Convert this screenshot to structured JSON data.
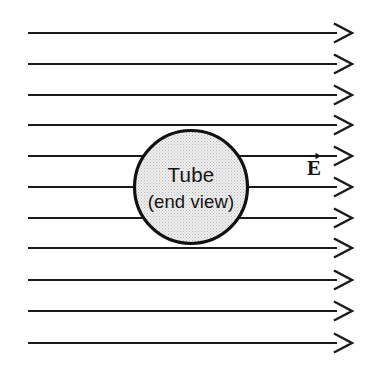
{
  "figure": {
    "kind": "physics-diagram",
    "background_color": "#ffffff",
    "ink_color": "#1a1a1a",
    "width": 375,
    "height": 370
  },
  "tube": {
    "label_line1": "Tube",
    "label_line2": "(end view)",
    "shape": "circle",
    "center_x": 191,
    "center_y": 187,
    "radius": 56.5,
    "fill_color": "#e8e8e8",
    "fill_pattern": "stipple-halftone",
    "stroke_color": "#111111",
    "stroke_width": 3.2
  },
  "field": {
    "symbol_letter": "E",
    "symbol_accent": "vector-arrow",
    "symbol_full": "E⃗",
    "symbol_x": 314,
    "symbol_y": 175,
    "direction": "left-to-right",
    "line_count": 11,
    "line_start_x": 28,
    "line_end_x": 337,
    "arrow_tip_x": 352,
    "arrow_half_height": 9,
    "line_y_positions": [
      33,
      64,
      95,
      125,
      156,
      187,
      218,
      248,
      280,
      311,
      343
    ],
    "lines_blocked_by_tube": [
      125,
      156,
      187,
      218,
      248
    ]
  }
}
